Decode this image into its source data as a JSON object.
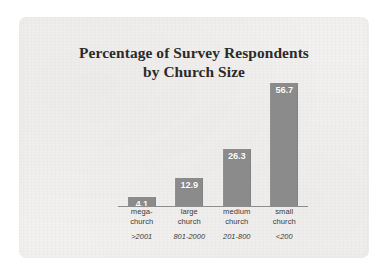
{
  "chart_data": {
    "type": "bar",
    "title": "Percentage of Survey Respondents by Church Size",
    "title_line1": "Percentage of Survey Respondents",
    "title_line2": "by Church Size",
    "xlabel": "",
    "ylabel": "",
    "ylim": [
      0,
      60
    ],
    "grid": false,
    "legend": "none",
    "orientation": "vertical",
    "value_label_position": "inside-top",
    "categories": [
      "mega-church",
      "large church",
      "medium church",
      "small church"
    ],
    "category_lines": [
      [
        "mega-",
        "church"
      ],
      [
        "large",
        "church"
      ],
      [
        "medium",
        "church"
      ],
      [
        "small",
        "church"
      ]
    ],
    "category_ranges": [
      ">2001",
      "801-2000",
      "201-800",
      "<200"
    ],
    "values": [
      4.1,
      12.9,
      26.3,
      56.7
    ],
    "value_labels": [
      "4.1",
      "12.9",
      "26.3",
      "56.7"
    ],
    "series": [
      {
        "name": "Percentage of survey respondents",
        "values": [
          4.1,
          12.9,
          26.3,
          56.7
        ]
      }
    ],
    "colors": {
      "bar": "#8b8b8b",
      "bar_label_text": "#ffffff",
      "axis_line": "#8d8d8d",
      "title_text": "#2b2a29",
      "category_text": "#3a3937",
      "panel_background": "#f2f1ef",
      "page_background": "#ffffff"
    }
  }
}
